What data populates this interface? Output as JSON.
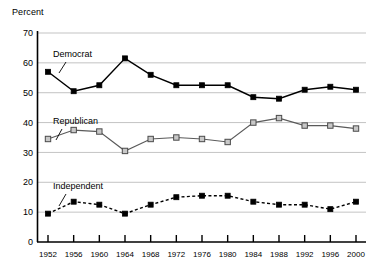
{
  "chart_data": {
    "type": "line",
    "title": "",
    "ylabel": "Percent",
    "xlabel": "",
    "ylim": [
      0,
      70
    ],
    "ytick_values": [
      0,
      10,
      20,
      30,
      40,
      50,
      60,
      70
    ],
    "ytick_labels": [
      "0",
      "10",
      "20",
      "30",
      "40",
      "50",
      "60",
      "70"
    ],
    "grid": "horizontal",
    "legend_position": "inline-annotations",
    "categories": [
      "1952",
      "1956",
      "1960",
      "1964",
      "1968",
      "1972",
      "1976",
      "1980",
      "1984",
      "1988",
      "1992",
      "1996",
      "2000"
    ],
    "series": [
      {
        "name": "Democrat",
        "marker": "filled-square",
        "line_style": "solid",
        "color": "#000000",
        "values": [
          57,
          50.5,
          52.5,
          61.5,
          56,
          52.5,
          52.5,
          52.5,
          48.5,
          48,
          51,
          52,
          51
        ]
      },
      {
        "name": "Republican",
        "marker": "open-square",
        "line_style": "solid",
        "color": "#808080",
        "values": [
          34.5,
          37.5,
          37,
          30.5,
          34.5,
          35,
          34.5,
          33.5,
          40,
          41.5,
          39,
          39,
          38
        ]
      },
      {
        "name": "Independent",
        "marker": "filled-square",
        "line_style": "dashed",
        "color": "#000000",
        "values": [
          9.5,
          13.5,
          12.5,
          9.5,
          12.5,
          15,
          15.5,
          15.5,
          13.5,
          12.5,
          12.5,
          11,
          13.5
        ]
      }
    ],
    "annotations": [
      {
        "text": "Democrat",
        "x_px": 53,
        "y_px": 57
      },
      {
        "text": "Republican",
        "x_px": 53,
        "y_px": 124
      },
      {
        "text": "Independent",
        "x_px": 53,
        "y_px": 189
      }
    ]
  }
}
